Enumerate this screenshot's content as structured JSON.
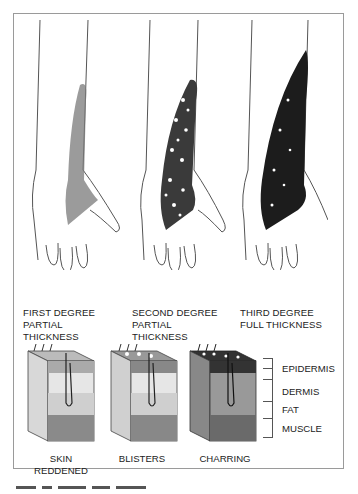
{
  "figure": {
    "hands": [
      {
        "degree": "FIRST DEGREE",
        "line2": "PARTIAL",
        "line3": "THICKNESS",
        "burn_color": "#6f6f6f",
        "burn_style": "reddened"
      },
      {
        "degree": "SECOND DEGREE",
        "line2": "PARTIAL",
        "line3": "THICKNESS",
        "burn_color": "#3a3a3a",
        "burn_style": "blisters"
      },
      {
        "degree": "THIRD DEGREE",
        "line2": "FULL THICKNESS",
        "line3": "",
        "burn_color": "#1a1a1a",
        "burn_style": "charring"
      }
    ],
    "skin_blocks": [
      {
        "caption_line1": "SKIN",
        "caption_line2": "REDDENED"
      },
      {
        "caption_line1": "BLISTERS",
        "caption_line2": ""
      },
      {
        "caption_line1": "CHARRING",
        "caption_line2": ""
      }
    ],
    "layers": [
      "EPIDERMIS",
      "DERMIS",
      "FAT",
      "MUSCLE"
    ],
    "colors": {
      "border": "#9a9a9a",
      "ink": "#222222",
      "skin": "#f2f2f2"
    }
  }
}
